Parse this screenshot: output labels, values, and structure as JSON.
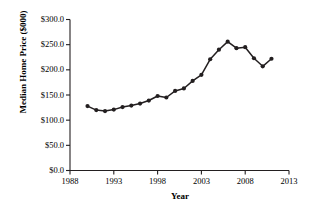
{
  "chart_data": {
    "type": "line",
    "title": "",
    "xlabel": "Year",
    "ylabel": "Median Home Price ($000)",
    "xlim": [
      1988,
      2013
    ],
    "ylim": [
      0,
      300
    ],
    "grid": false,
    "legend": "none",
    "marker": "filled-circle",
    "line_color": "#231f20",
    "x": [
      1990,
      1991,
      1992,
      1993,
      1994,
      1995,
      1996,
      1997,
      1998,
      1999,
      2000,
      2001,
      2002,
      2003,
      2004,
      2005,
      2006,
      2007,
      2008,
      2009,
      2010,
      2011
    ],
    "values": [
      128.0,
      120.0,
      118.0,
      121.0,
      126.0,
      129.0,
      133.0,
      139.0,
      148.0,
      145.0,
      158.0,
      163.0,
      178.0,
      190.0,
      221.0,
      240.0,
      256.0,
      243.0,
      245.0,
      223.0,
      207.0,
      222.0
    ],
    "series": [
      {
        "name": "Median Home Price",
        "values": [
          128.0,
          120.0,
          118.0,
          121.0,
          126.0,
          129.0,
          133.0,
          139.0,
          148.0,
          145.0,
          158.0,
          163.0,
          178.0,
          190.0,
          221.0,
          240.0,
          256.0,
          243.0,
          245.0,
          223.0,
          207.0,
          222.0
        ]
      }
    ],
    "yticks": [
      0,
      50,
      100,
      150,
      200,
      250,
      300
    ],
    "ytick_labels": [
      "$0.0",
      "$50.0",
      "$100.0",
      "$150.0",
      "$200.0",
      "$250.0",
      "$300.0"
    ],
    "xticks": [
      1988,
      1993,
      1998,
      2003,
      2008,
      2013
    ],
    "xtick_labels": [
      "1988",
      "1993",
      "1998",
      "2003",
      "2008",
      "2013"
    ]
  }
}
